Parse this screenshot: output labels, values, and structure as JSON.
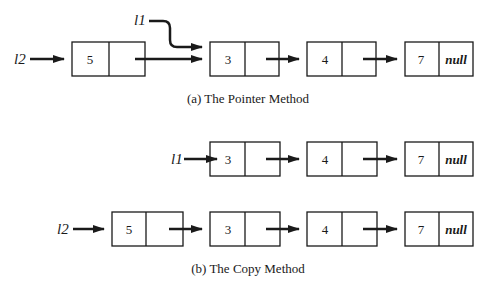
{
  "diagram": {
    "part_a": {
      "caption": "(a)  The Pointer Method",
      "vars": {
        "l1": "l1",
        "l2": "l2"
      },
      "nodes": [
        {
          "value": "5",
          "next": ""
        },
        {
          "value": "3",
          "next": ""
        },
        {
          "value": "4",
          "next": ""
        },
        {
          "value": "7",
          "next": "null"
        }
      ]
    },
    "part_b": {
      "caption": "(b)  The Copy Method",
      "list_l1": {
        "var": "l1",
        "nodes": [
          {
            "value": "3",
            "next": ""
          },
          {
            "value": "4",
            "next": ""
          },
          {
            "value": "7",
            "next": "null"
          }
        ]
      },
      "list_l2": {
        "var": "l2",
        "nodes": [
          {
            "value": "5",
            "next": ""
          },
          {
            "value": "3",
            "next": ""
          },
          {
            "value": "4",
            "next": ""
          },
          {
            "value": "7",
            "next": "null"
          }
        ]
      }
    },
    "colors": {
      "line": "#1a1a1a",
      "background": "#ffffff"
    }
  }
}
